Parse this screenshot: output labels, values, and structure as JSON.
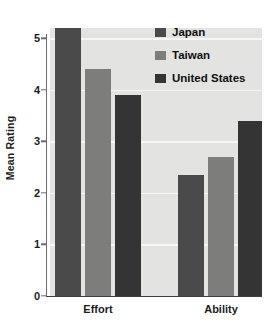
{
  "chart_data": {
    "type": "bar",
    "title": "",
    "subtitle": "",
    "xlabel": "",
    "ylabel": "Mean Rating",
    "categories": [
      "Effort",
      "Ability"
    ],
    "series": [
      {
        "name": "Japan",
        "values": [
          5.2,
          2.35
        ],
        "color": "#4a4a4a"
      },
      {
        "name": "Taiwan",
        "values": [
          4.4,
          2.7
        ],
        "color": "#7d7d7b"
      },
      {
        "name": "United States",
        "values": [
          3.9,
          3.4
        ],
        "color": "#343434"
      }
    ],
    "ylim": [
      0,
      5.2
    ],
    "yticks": [
      0,
      1,
      2,
      3,
      4,
      5
    ],
    "ytick_labels": [
      "0",
      "1",
      "2",
      "3",
      "4",
      "5"
    ],
    "grid": true,
    "grid_axis": "y",
    "legend_position": "top-right",
    "plot_background": "#e3e3e1",
    "figure_background": "#ffffff",
    "gridline_color": "#f6f6f4",
    "axis_color": "#6b6b6b",
    "text_color": "#1c1c1c"
  }
}
